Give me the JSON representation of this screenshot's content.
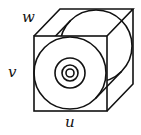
{
  "diagram": {
    "type": "cube-with-cylinder-and-concentric-circles",
    "labels": {
      "width_axis": "u",
      "height_axis": "v",
      "depth_axis": "w"
    },
    "colors": {
      "stroke": "#111111",
      "background": "#ffffff"
    },
    "shapes": {
      "front_square": {
        "x": 34,
        "y": 36,
        "w": 73,
        "h": 75
      },
      "depth_offset": {
        "dx": 26,
        "dy": -27
      },
      "front_circle": {
        "cx": 70,
        "cy": 73,
        "r": 36
      },
      "back_circle": {
        "cx": 96,
        "cy": 46,
        "r": 36
      },
      "concentric_radii": [
        15,
        8,
        4
      ]
    }
  }
}
